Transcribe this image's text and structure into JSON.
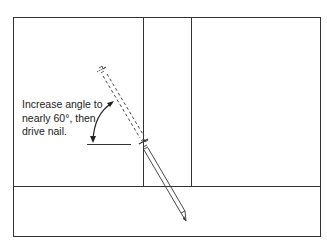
{
  "diagram": {
    "type": "toenailing-stud-illustration",
    "annotation": {
      "lines": [
        "Increase angle to",
        "nearly 60°, then",
        "drive nail."
      ]
    },
    "angle_degrees": "60°",
    "colors": {
      "line": "#333333",
      "background": "#ffffff"
    },
    "components": [
      "outer-frame",
      "stud-left-edge",
      "stud-right-edge",
      "bottom-plate",
      "nail-initial-position-dashed",
      "nail-driven",
      "angle-arc-arrow",
      "horizontal-reference-line"
    ]
  }
}
